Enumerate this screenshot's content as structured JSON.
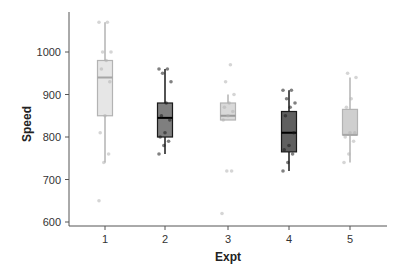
{
  "chart_data": {
    "type": "box",
    "title": "",
    "xlabel": "Expt",
    "ylabel": "Speed",
    "ylim": [
      595,
      1080
    ],
    "yticks": [
      600,
      700,
      800,
      900,
      1000
    ],
    "categories": [
      "1",
      "2",
      "3",
      "4",
      "5"
    ],
    "grid": false,
    "legend": null,
    "series": [
      {
        "name": "1",
        "fill": "#e6e6e6",
        "stroke": "#b3b3b3",
        "median_color": "#a6a6a6",
        "whisker_low": 740,
        "q1": 850,
        "median": 940,
        "q3": 980,
        "whisker_high": 1070,
        "points": [
          650,
          740,
          760,
          810,
          850,
          930,
          960,
          980,
          1000,
          1000,
          1070,
          1070
        ]
      },
      {
        "name": "2",
        "fill": "#7f7f7f",
        "stroke": "#1a1a1a",
        "median_color": "#000000",
        "whisker_low": 760,
        "q1": 800,
        "median": 845,
        "q3": 880,
        "whisker_high": 960,
        "points": [
          760,
          780,
          790,
          800,
          810,
          840,
          850,
          880,
          930,
          950,
          960,
          960
        ]
      },
      {
        "name": "3",
        "fill": "#d9d9d9",
        "stroke": "#b3b3b3",
        "median_color": "#999999",
        "whisker_low": 840,
        "q1": 840,
        "median": 850,
        "q3": 880,
        "whisker_high": 900,
        "points": [
          620,
          720,
          720,
          840,
          850,
          860,
          870,
          880,
          900,
          930,
          970
        ]
      },
      {
        "name": "4",
        "fill": "#5f5f5f",
        "stroke": "#1a1a1a",
        "median_color": "#000000",
        "whisker_low": 720,
        "q1": 765,
        "median": 810,
        "q3": 860,
        "whisker_high": 910,
        "points": [
          720,
          740,
          760,
          770,
          780,
          810,
          850,
          870,
          880,
          890,
          910,
          910
        ]
      },
      {
        "name": "5",
        "fill": "#cfcfcf",
        "stroke": "#b3b3b3",
        "median_color": "#a6a6a6",
        "whisker_low": 740,
        "q1": 805,
        "median": 805,
        "q3": 865,
        "whisker_high": 940,
        "points": [
          740,
          760,
          790,
          800,
          810,
          810,
          870,
          890,
          940,
          950
        ]
      }
    ]
  },
  "axes": {
    "x_title": "Expt",
    "y_title": "Speed",
    "y_tick_labels": [
      "600",
      "700",
      "800",
      "900",
      "1000"
    ],
    "x_tick_labels": [
      "1",
      "2",
      "3",
      "4",
      "5"
    ]
  }
}
